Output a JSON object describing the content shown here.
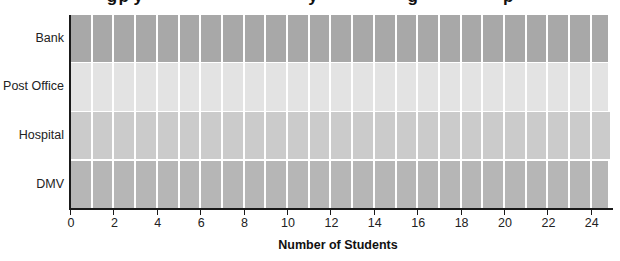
{
  "chart_data": {
    "type": "bar",
    "orientation": "horizontal",
    "title": "(title clipped at top edge — only descenders visible)",
    "categories": [
      "Bank",
      "Post Office",
      "Hospital",
      "DMV"
    ],
    "values": [
      24.8,
      24.8,
      24.9,
      24.8
    ],
    "colors": [
      "#a8a8a8",
      "#e3e3e3",
      "#cbcbcb",
      "#b6b6b6"
    ],
    "segmented": true,
    "segment_unit": 1,
    "xlabel": "Number of Students",
    "ylabel": "",
    "xlim": [
      0,
      25
    ],
    "xticks": [
      0,
      2,
      4,
      6,
      8,
      10,
      12,
      14,
      16,
      18,
      20,
      22,
      24
    ],
    "grid": false,
    "legend": null
  },
  "layout": {
    "plot_left": 70,
    "plot_top": 15,
    "px_per_unit": 21.7,
    "row_tops": [
      15,
      63,
      112,
      161
    ],
    "row_heights": [
      47,
      48,
      47,
      47
    ]
  }
}
